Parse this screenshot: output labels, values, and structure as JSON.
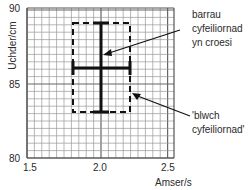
{
  "chart_data": {
    "type": "scatter",
    "title": "",
    "xlabel": "Amser/s",
    "ylabel": "Uchder/cm",
    "xlim": [
      1.5,
      2.5
    ],
    "ylim": [
      80,
      90
    ],
    "x_ticks": [
      "1.5",
      "2.0",
      "2.5"
    ],
    "y_ticks": [
      "80",
      "85",
      "90"
    ],
    "grid": true,
    "points": [
      {
        "x": 2.0,
        "y": 86.1,
        "x_error": [
          1.8,
          2.22
        ],
        "y_error": [
          83.1,
          89.1
        ]
      }
    ],
    "error_box": {
      "x_min": 1.8,
      "x_max": 2.22,
      "y_min": 83.1,
      "y_max": 89.1,
      "style": "dashed"
    },
    "annotations": [
      {
        "text": "barrau cyfeiliornad yn croesi",
        "target": "error-bars-cross"
      },
      {
        "text": "'blwch cyfeiliornad'",
        "target": "error-box"
      }
    ]
  },
  "axes": {
    "xlabel": "Amser/s",
    "ylabel": "Uchder/cm",
    "x_ticks": [
      "1.5",
      "2.0",
      "2.5"
    ],
    "y_ticks": [
      "90",
      "85",
      "80"
    ]
  },
  "annotations": {
    "crossbars": [
      "barrau",
      "cyfeiliornad",
      "yn croesi"
    ],
    "box": [
      "'blwch",
      "cyfeiliornad'"
    ]
  }
}
